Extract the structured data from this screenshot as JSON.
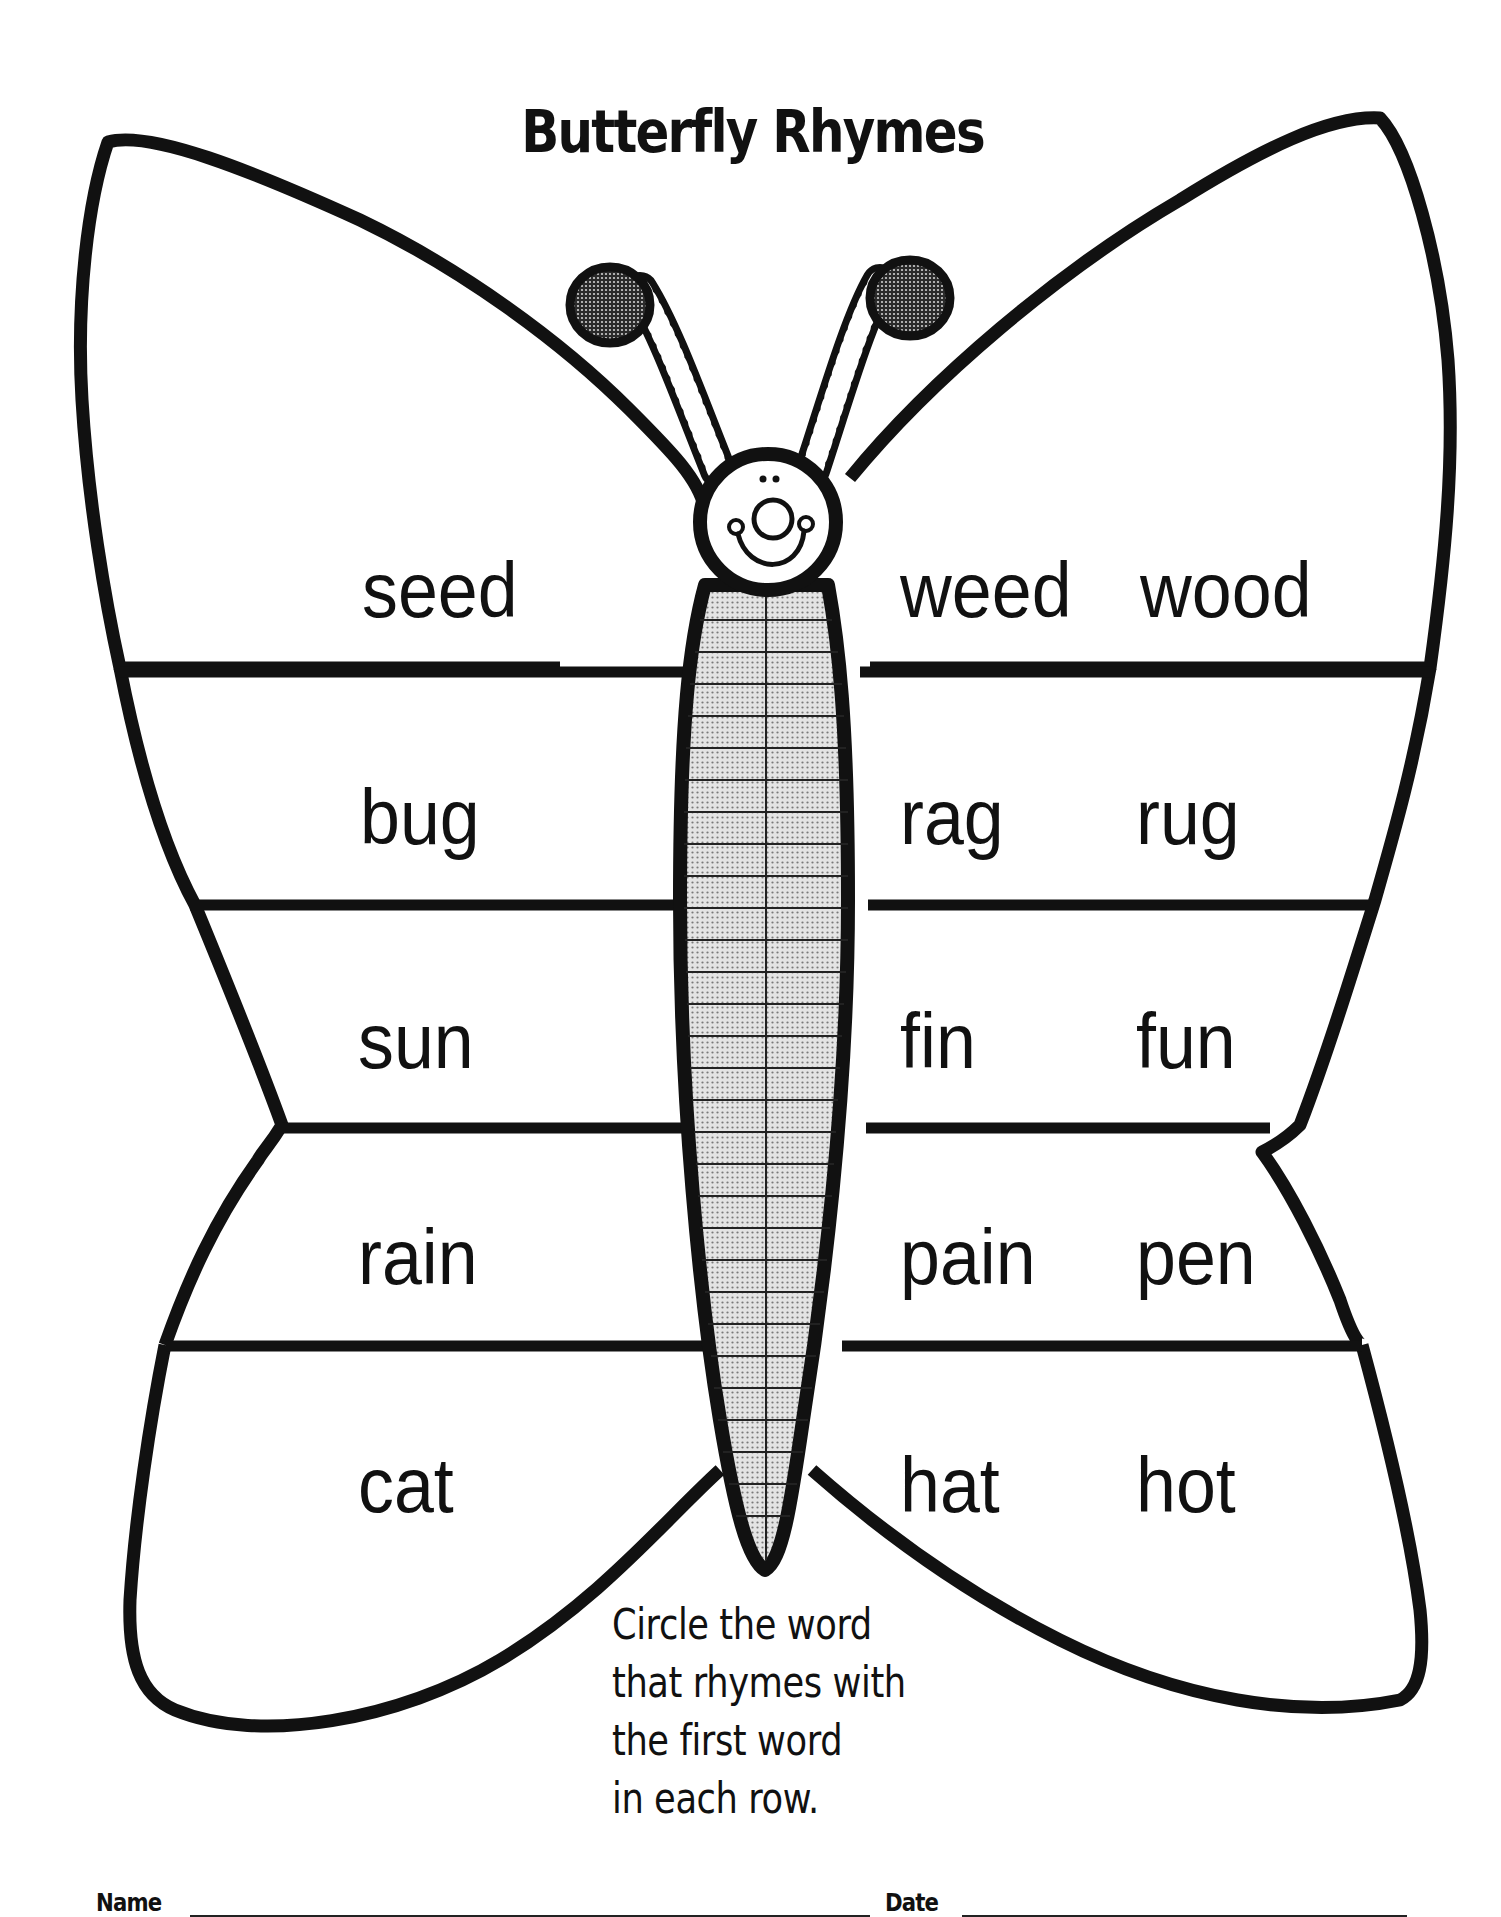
{
  "worksheet": {
    "title": "Butterfly Rhymes",
    "instructions": [
      "Circle the word",
      "that rhymes with",
      "the first word",
      "in each row."
    ],
    "rows": [
      {
        "target": "seed",
        "choices": [
          "weed",
          "wood"
        ]
      },
      {
        "target": "bug",
        "choices": [
          "rag",
          "rug"
        ]
      },
      {
        "target": "sun",
        "choices": [
          "fin",
          "fun"
        ]
      },
      {
        "target": "rain",
        "choices": [
          "pain",
          "pen"
        ]
      },
      {
        "target": "cat",
        "choices": [
          "hat",
          "hot"
        ]
      }
    ],
    "footer": {
      "name_label": "Name",
      "date_label": "Date"
    }
  },
  "colors": {
    "ink": "#111111",
    "paper": "#ffffff",
    "body_fill": "#d4d4d4",
    "antenna_tip_fill": "#555555"
  }
}
